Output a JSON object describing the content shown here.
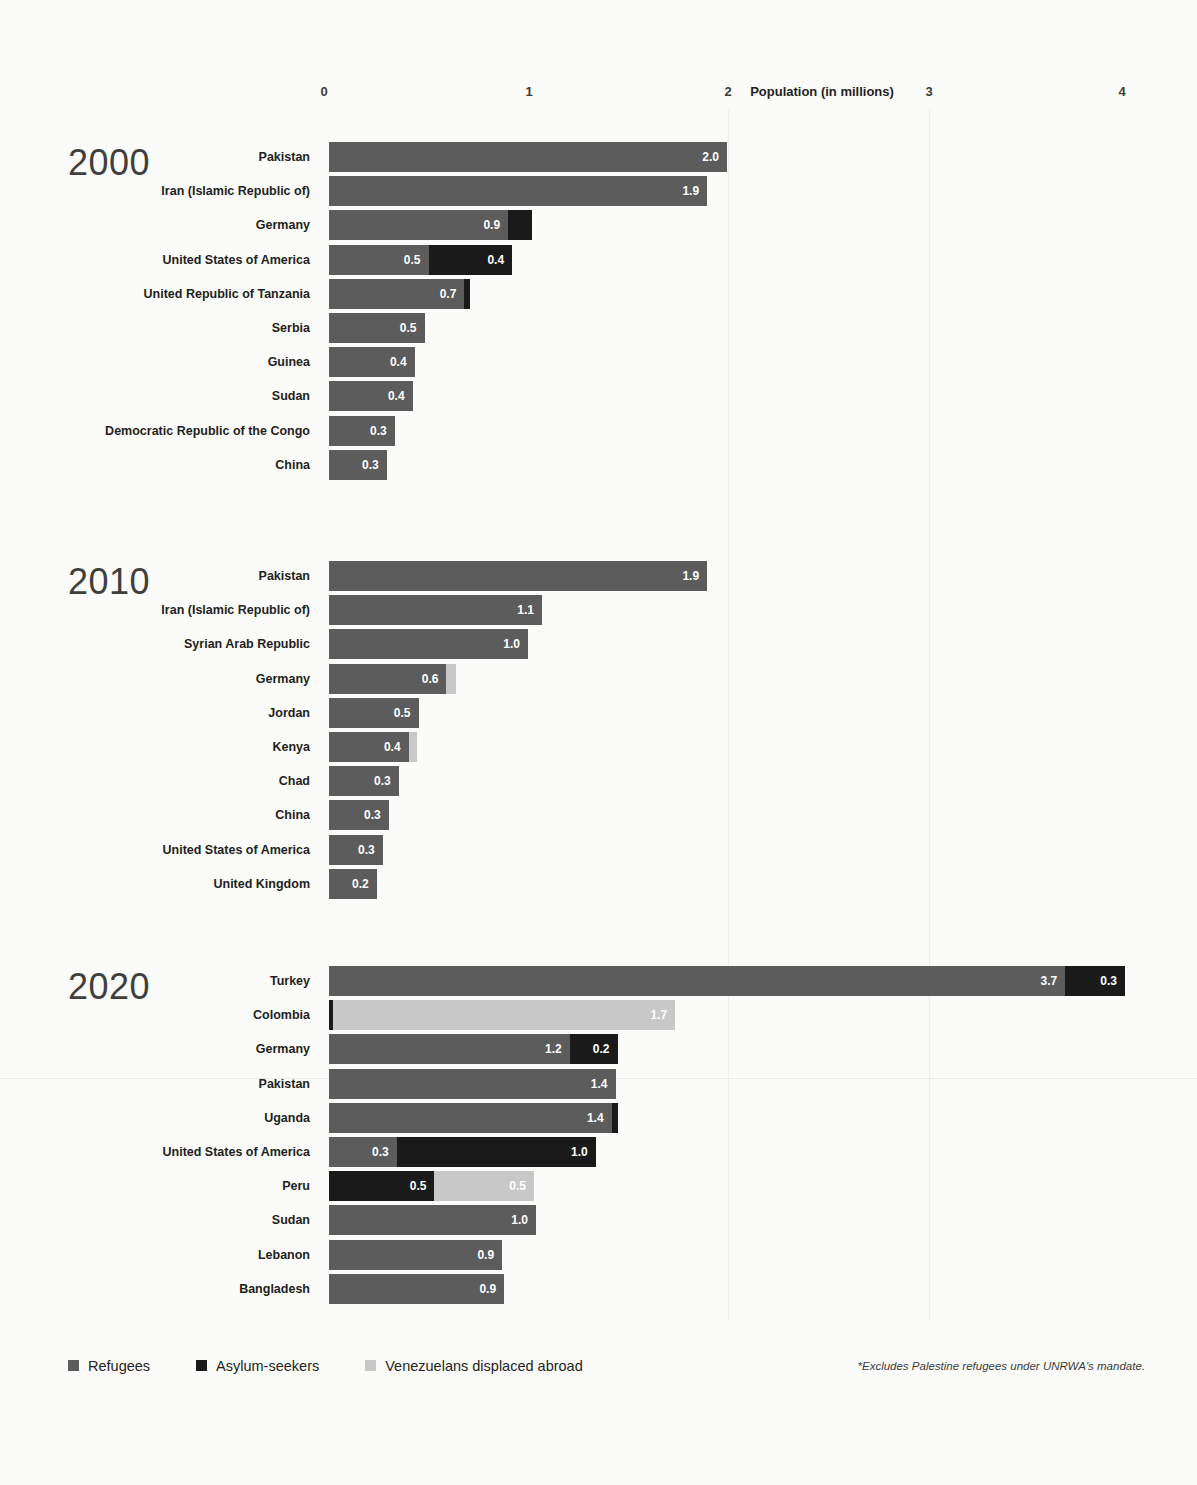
{
  "chart_data": {
    "type": "bar",
    "orientation": "horizontal",
    "stacked": true,
    "title": "",
    "xlabel": "Population (in millions)",
    "ylabel": "",
    "xlim": [
      0,
      4.2
    ],
    "xticks": [
      "0",
      "1",
      "2",
      "3",
      "4"
    ],
    "xtick_values": [
      0,
      1,
      2,
      3,
      4
    ],
    "grid": true,
    "legend_position": "bottom-left",
    "series": [
      {
        "name": "Refugees",
        "color": "#5c5c5c"
      },
      {
        "name": "Asylum-seekers",
        "color": "#1a1a1a"
      },
      {
        "name": "Venezuelans displaced abroad",
        "color": "#c8c8c8"
      }
    ],
    "footnote": "*Excludes Palestine refugees under UNRWA's mandate.",
    "panels": [
      {
        "year": "2000",
        "rows": [
          {
            "label": "Pakistan",
            "segments": [
              {
                "series": "Refugees",
                "value": 2.0,
                "label": "2.0"
              }
            ]
          },
          {
            "label": "Iran (Islamic Republic of)",
            "segments": [
              {
                "series": "Refugees",
                "value": 1.9,
                "label": "1.9"
              }
            ]
          },
          {
            "label": "Germany",
            "segments": [
              {
                "series": "Refugees",
                "value": 0.9,
                "label": "0.9"
              },
              {
                "series": "Asylum-seekers",
                "value": 0.12,
                "label": ""
              }
            ]
          },
          {
            "label": "United States of America",
            "segments": [
              {
                "series": "Refugees",
                "value": 0.5,
                "label": "0.5"
              },
              {
                "series": "Asylum-seekers",
                "value": 0.42,
                "label": "0.4"
              }
            ]
          },
          {
            "label": "United Republic of Tanzania",
            "segments": [
              {
                "series": "Refugees",
                "value": 0.68,
                "label": "0.7"
              },
              {
                "series": "Asylum-seekers",
                "value": 0.03,
                "label": ""
              }
            ]
          },
          {
            "label": "Serbia",
            "segments": [
              {
                "series": "Refugees",
                "value": 0.48,
                "label": "0.5"
              }
            ]
          },
          {
            "label": "Guinea",
            "segments": [
              {
                "series": "Refugees",
                "value": 0.43,
                "label": "0.4"
              }
            ]
          },
          {
            "label": "Sudan",
            "segments": [
              {
                "series": "Refugees",
                "value": 0.42,
                "label": "0.4"
              }
            ]
          },
          {
            "label": "Democratic Republic of the Congo",
            "segments": [
              {
                "series": "Refugees",
                "value": 0.33,
                "label": "0.3"
              }
            ]
          },
          {
            "label": "China",
            "segments": [
              {
                "series": "Refugees",
                "value": 0.29,
                "label": "0.3"
              }
            ]
          }
        ]
      },
      {
        "year": "2010",
        "rows": [
          {
            "label": "Pakistan",
            "segments": [
              {
                "series": "Refugees",
                "value": 1.9,
                "label": "1.9"
              }
            ]
          },
          {
            "label": "Iran (Islamic Republic of)",
            "segments": [
              {
                "series": "Refugees",
                "value": 1.07,
                "label": "1.1"
              }
            ]
          },
          {
            "label": "Syrian Arab Republic",
            "segments": [
              {
                "series": "Refugees",
                "value": 1.0,
                "label": "1.0"
              }
            ]
          },
          {
            "label": "Germany",
            "segments": [
              {
                "series": "Refugees",
                "value": 0.59,
                "label": "0.6"
              },
              {
                "series": "Venezuelans displaced abroad",
                "value": 0.05,
                "label": ""
              }
            ]
          },
          {
            "label": "Jordan",
            "segments": [
              {
                "series": "Refugees",
                "value": 0.45,
                "label": "0.5"
              }
            ]
          },
          {
            "label": "Kenya",
            "segments": [
              {
                "series": "Refugees",
                "value": 0.4,
                "label": "0.4"
              },
              {
                "series": "Venezuelans displaced abroad",
                "value": 0.04,
                "label": ""
              }
            ]
          },
          {
            "label": "Chad",
            "segments": [
              {
                "series": "Refugees",
                "value": 0.35,
                "label": "0.3"
              }
            ]
          },
          {
            "label": "China",
            "segments": [
              {
                "series": "Refugees",
                "value": 0.3,
                "label": "0.3"
              }
            ]
          },
          {
            "label": "United States of America",
            "segments": [
              {
                "series": "Refugees",
                "value": 0.27,
                "label": "0.3"
              }
            ]
          },
          {
            "label": "United Kingdom",
            "segments": [
              {
                "series": "Refugees",
                "value": 0.24,
                "label": "0.2"
              }
            ]
          }
        ]
      },
      {
        "year": "2020",
        "rows": [
          {
            "label": "Turkey",
            "segments": [
              {
                "series": "Refugees",
                "value": 3.7,
                "label": "3.7"
              },
              {
                "series": "Asylum-seekers",
                "value": 0.3,
                "label": "0.3"
              }
            ]
          },
          {
            "label": "Colombia",
            "segments": [
              {
                "series": "Asylum-seekers",
                "value": 0.02,
                "label": ""
              },
              {
                "series": "Venezuelans displaced abroad",
                "value": 1.72,
                "label": "1.7"
              }
            ]
          },
          {
            "label": "Germany",
            "segments": [
              {
                "series": "Refugees",
                "value": 1.21,
                "label": "1.2"
              },
              {
                "series": "Asylum-seekers",
                "value": 0.24,
                "label": "0.2"
              }
            ]
          },
          {
            "label": "Pakistan",
            "segments": [
              {
                "series": "Refugees",
                "value": 1.44,
                "label": "1.4"
              }
            ]
          },
          {
            "label": "Uganda",
            "segments": [
              {
                "series": "Refugees",
                "value": 1.42,
                "label": "1.4"
              },
              {
                "series": "Asylum-seekers",
                "value": 0.03,
                "label": ""
              }
            ]
          },
          {
            "label": "United States of America",
            "segments": [
              {
                "series": "Refugees",
                "value": 0.34,
                "label": "0.3"
              },
              {
                "series": "Asylum-seekers",
                "value": 1.0,
                "label": "1.0"
              }
            ]
          },
          {
            "label": "Peru",
            "segments": [
              {
                "series": "Asylum-seekers",
                "value": 0.53,
                "label": "0.5"
              },
              {
                "series": "Venezuelans displaced abroad",
                "value": 0.5,
                "label": "0.5"
              }
            ]
          },
          {
            "label": "Sudan",
            "segments": [
              {
                "series": "Refugees",
                "value": 1.04,
                "label": "1.0"
              }
            ]
          },
          {
            "label": "Lebanon",
            "segments": [
              {
                "series": "Refugees",
                "value": 0.87,
                "label": "0.9"
              }
            ]
          },
          {
            "label": "Bangladesh",
            "segments": [
              {
                "series": "Refugees",
                "value": 0.88,
                "label": "0.9"
              }
            ]
          }
        ]
      }
    ]
  },
  "axis": {
    "title": "Population (in millions)",
    "ticks": [
      "0",
      "1",
      "2",
      "3",
      "4"
    ]
  },
  "legend": {
    "items": [
      {
        "label": "Refugees",
        "key": "refugees"
      },
      {
        "label": "Asylum-seekers",
        "key": "asylum"
      },
      {
        "label": "Venezuelans displaced abroad",
        "key": "venezuelans"
      }
    ]
  },
  "footnote": "*Excludes Palestine refugees under UNRWA's mandate."
}
